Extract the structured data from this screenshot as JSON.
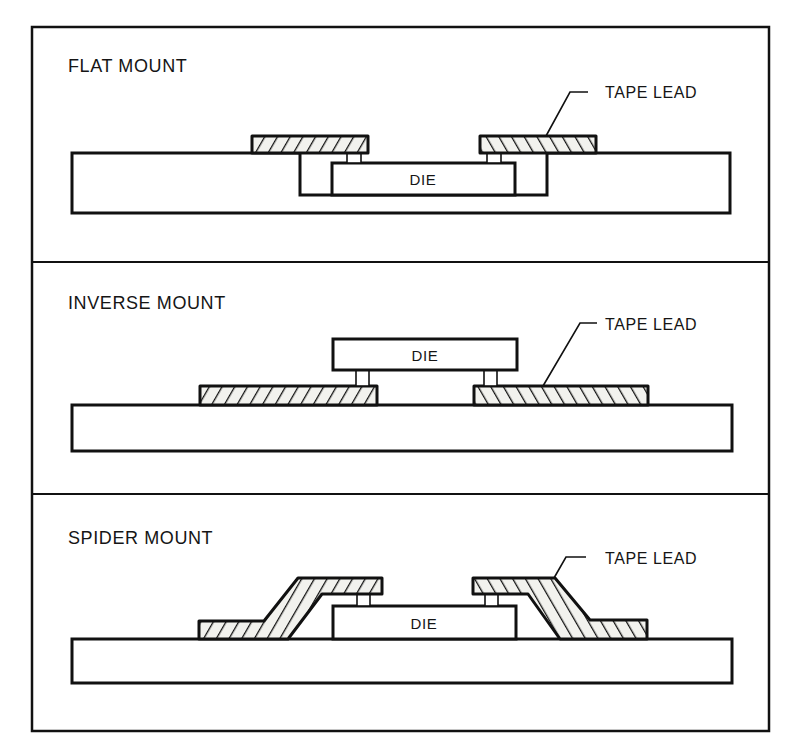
{
  "figure": {
    "frame_color": "#111111",
    "background": "#ffffff",
    "panels": [
      {
        "id": "flat",
        "title": "FLAT MOUNT",
        "callout": "TAPE LEAD",
        "die_label": "DIE"
      },
      {
        "id": "inverse",
        "title": "INVERSE MOUNT",
        "callout": "TAPE LEAD",
        "die_label": "DIE"
      },
      {
        "id": "spider",
        "title": "SPIDER MOUNT",
        "callout": "TAPE LEAD",
        "die_label": "DIE"
      }
    ]
  }
}
